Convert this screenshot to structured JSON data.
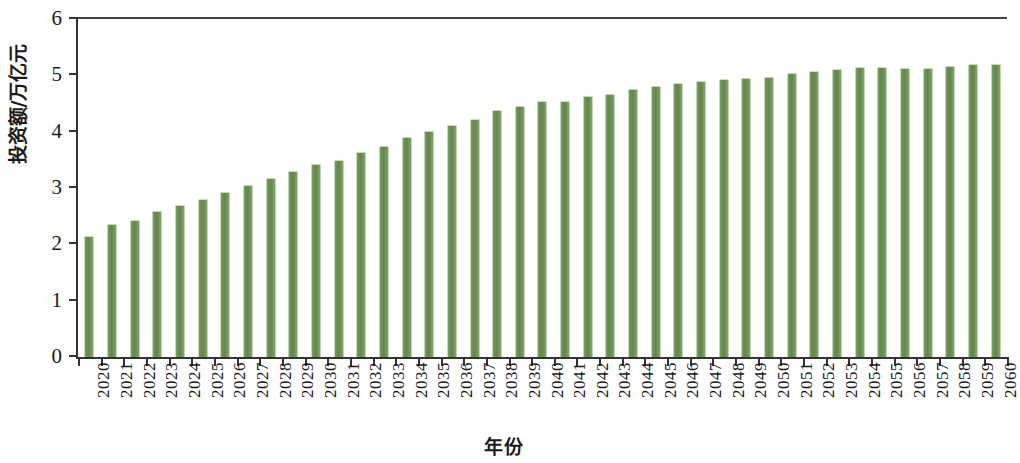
{
  "chart_data": {
    "type": "bar",
    "title": "",
    "xlabel": "年份",
    "ylabel": "投资额/万亿元",
    "ylim": [
      0,
      6
    ],
    "yticks": [
      0,
      1,
      2,
      3,
      4,
      5,
      6
    ],
    "ytick_labels": [
      "0",
      "1",
      "2",
      "3",
      "4",
      "5",
      "6"
    ],
    "grid": false,
    "legend": null,
    "bar_color": "#6d9455",
    "axis_color": "#333333",
    "categories": [
      "2020",
      "2021",
      "2022",
      "2023",
      "2024",
      "2025",
      "2026",
      "2027",
      "2028",
      "2029",
      "2030",
      "2031",
      "2032",
      "2033",
      "2034",
      "2035",
      "2036",
      "2037",
      "2038",
      "2039",
      "2040",
      "2041",
      "2042",
      "2043",
      "2044",
      "2045",
      "2046",
      "2047",
      "2048",
      "2049",
      "2050",
      "2051",
      "2052",
      "2053",
      "2054",
      "2055",
      "2056",
      "2057",
      "2058",
      "2059",
      "2060"
    ],
    "values": [
      2.13,
      2.34,
      2.42,
      2.58,
      2.68,
      2.78,
      2.92,
      3.04,
      3.16,
      3.28,
      3.41,
      3.48,
      3.62,
      3.73,
      3.88,
      4.0,
      4.1,
      4.21,
      4.36,
      4.44,
      4.53,
      4.53,
      4.61,
      4.66,
      4.74,
      4.79,
      4.84,
      4.88,
      4.92,
      4.93,
      4.95,
      5.02,
      5.06,
      5.09,
      5.13,
      5.13,
      5.12,
      5.12,
      5.14,
      5.18,
      5.18
    ]
  }
}
